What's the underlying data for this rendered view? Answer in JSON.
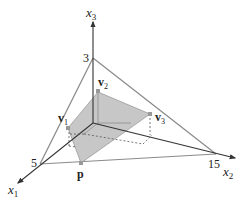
{
  "diagram": {
    "type": "3d-coordinate-region",
    "axes": [
      {
        "name": "x1",
        "label_base": "x",
        "label_sub": "1",
        "intercept_label": "5"
      },
      {
        "name": "x2",
        "label_base": "x",
        "label_sub": "2",
        "intercept_label": "15"
      },
      {
        "name": "x3",
        "label_base": "x",
        "label_sub": "3",
        "intercept_label": "3"
      }
    ],
    "points": [
      {
        "name": "v1",
        "label_base": "v",
        "label_sub": "1"
      },
      {
        "name": "v2",
        "label_base": "v",
        "label_sub": "2"
      },
      {
        "name": "v3",
        "label_base": "v",
        "label_sub": "3"
      },
      {
        "name": "p",
        "label_base": "p",
        "label_sub": ""
      }
    ],
    "colors": {
      "axis": "#333333",
      "plane_edge": "#888888",
      "region_fill": "#bdbdbd",
      "region_edge": "#9a9a9a",
      "dashed": "#555555"
    }
  }
}
